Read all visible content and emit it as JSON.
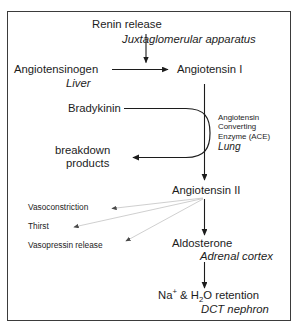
{
  "diagram": {
    "border_color": "#3b3b3b",
    "arrow_color": "#1c1c1c",
    "faint_arrow_color": "#c8c8c8",
    "nodes": {
      "renin_release": "Renin release",
      "juxtaglomerular": "Juxtaglomerular apparatus",
      "angiotensinogen": "Angiotensinogen",
      "liver": "Liver",
      "angiotensin_1": "Angiotensin I",
      "bradykinin": "Bradykinin",
      "ace_line1": "Angiotensin",
      "ace_line2": "Converting",
      "ace_line3": "Enzyme (ACE)",
      "lung": "Lung",
      "breakdown_line1": "breakdown",
      "breakdown_line2": "products",
      "angiotensin_2": "Angiotensin II",
      "vasoconstriction": "Vasoconstriction",
      "thirst": "Thirst",
      "vasopressin_release": "Vasopressin release",
      "aldosterone": "Aldosterone",
      "adrenal_cortex": "Adrenal cortex",
      "na_h2o_prefix": "Na",
      "na_charge": "+",
      "na_mid": " & H",
      "h2o_sub": "2",
      "na_suffix": "O retention",
      "dct_nephron": "DCT nephron"
    }
  }
}
